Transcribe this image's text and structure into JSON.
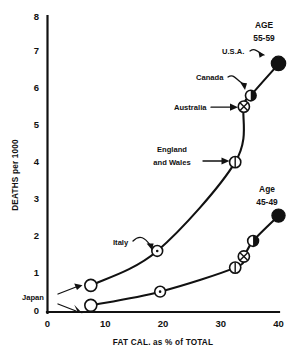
{
  "chart_data": {
    "type": "line",
    "title": "",
    "xlabel": "FAT CAL. as % of TOTAL",
    "ylabel": "DEATHS  per 1000",
    "xlim": [
      0,
      40
    ],
    "ylim": [
      0,
      8
    ],
    "xticks": [
      "0",
      "10",
      "20",
      "30",
      "40"
    ],
    "xtick_values": [
      0,
      10,
      20,
      30,
      40
    ],
    "yticks": [
      "0",
      "1",
      "2",
      "3",
      "4",
      "5",
      "6",
      "7",
      "8"
    ],
    "ytick_values": [
      0,
      1,
      2,
      3,
      4,
      5,
      6,
      7,
      8
    ],
    "grid": false,
    "legend_position": "none",
    "series": [
      {
        "name": "AGE 55-59",
        "label": "AGE",
        "label_range": "55-59",
        "points": [
          {
            "country": "Japan",
            "x": 7.5,
            "y": 0.72,
            "marker": "open-circle"
          },
          {
            "country": "Italy",
            "x": 19.0,
            "y": 1.65,
            "marker": "circle-dot"
          },
          {
            "country": "England and Wales",
            "x": 32.5,
            "y": 4.05,
            "marker": "circle-vbar"
          },
          {
            "country": "Australia",
            "x": 34.0,
            "y": 5.55,
            "marker": "circle-cross"
          },
          {
            "country": "Canada",
            "x": 35.2,
            "y": 5.85,
            "marker": "circle-half-filled"
          },
          {
            "country": "U.S.A.",
            "x": 40.0,
            "y": 6.7,
            "marker": "filled-circle"
          }
        ]
      },
      {
        "name": "Age 45-49",
        "label": "Age",
        "label_range": "45-49",
        "points": [
          {
            "country": "Japan",
            "x": 7.5,
            "y": 0.18,
            "marker": "open-circle"
          },
          {
            "country": "Italy",
            "x": 19.5,
            "y": 0.55,
            "marker": "circle-dot"
          },
          {
            "country": "England and Wales",
            "x": 32.5,
            "y": 1.2,
            "marker": "circle-vbar"
          },
          {
            "country": "Australia",
            "x": 34.0,
            "y": 1.5,
            "marker": "circle-cross"
          },
          {
            "country": "Canada",
            "x": 35.6,
            "y": 1.92,
            "marker": "circle-half-filled"
          },
          {
            "country": "U.S.A.",
            "x": 40.0,
            "y": 2.6,
            "marker": "filled-circle"
          }
        ]
      }
    ],
    "annotations": [
      {
        "id": "age-5559",
        "text_line1": "AGE",
        "text_line2": "55-59"
      },
      {
        "id": "usa",
        "text": "U.S.A."
      },
      {
        "id": "canada",
        "text": "Canada"
      },
      {
        "id": "australia",
        "text": "Australia"
      },
      {
        "id": "england",
        "text_line1": "England",
        "text_line2": "and Wales"
      },
      {
        "id": "italy",
        "text": "Italy"
      },
      {
        "id": "japan",
        "text": "Japan"
      },
      {
        "id": "age-4549",
        "text_line1": "Age",
        "text_line2": "45-49"
      }
    ],
    "colors": {
      "ink": "#111111",
      "background": "#ffffff",
      "marker_fill": "#ffffff"
    }
  }
}
